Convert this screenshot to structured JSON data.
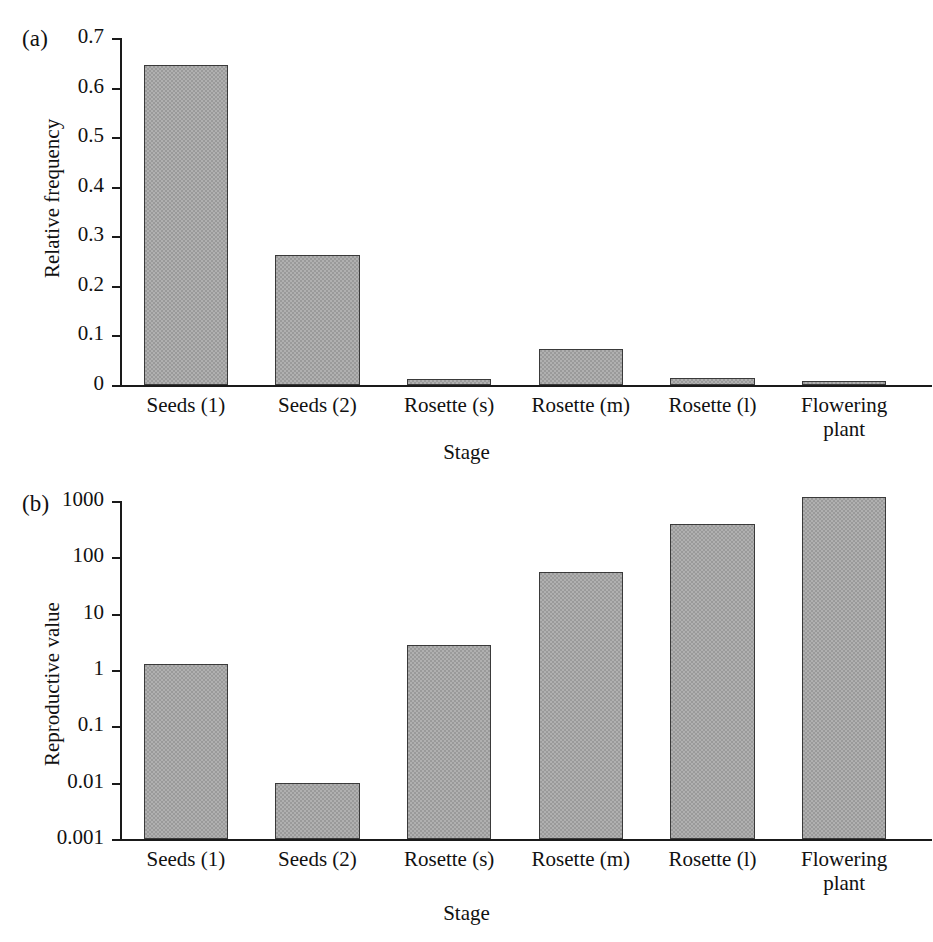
{
  "figure": {
    "panels": [
      {
        "tag": "(a)",
        "ylabel": "Relative frequency",
        "xlabel": "Stage"
      },
      {
        "tag": "(b)",
        "ylabel": "Reproductive value",
        "xlabel": "Stage"
      }
    ]
  },
  "chart_data": [
    {
      "type": "bar",
      "panel": "(a)",
      "title": "",
      "xlabel": "Stage",
      "ylabel": "Relative frequency",
      "categories": [
        "Seeds (1)",
        "Seeds (2)",
        "Rosette (s)",
        "Rosette (m)",
        "Rosette (l)",
        "Flowering plant"
      ],
      "values": [
        0.645,
        0.263,
        0.012,
        0.073,
        0.014,
        0.008
      ],
      "yscale": "linear",
      "ylim": [
        0,
        0.7
      ],
      "yticks": [
        0,
        0.1,
        0.2,
        0.3,
        0.4,
        0.5,
        0.6,
        0.7
      ],
      "ytick_labels": [
        "0",
        "0.1",
        "0.2",
        "0.3",
        "0.4",
        "0.5",
        "0.6",
        "0.7"
      ],
      "grid": false,
      "legend": false,
      "bar_color": "#9a9a9a",
      "bar_edge_color": "#3a3a3a"
    },
    {
      "type": "bar",
      "panel": "(b)",
      "title": "",
      "xlabel": "Stage",
      "ylabel": "Reproductive value",
      "categories": [
        "Seeds (1)",
        "Seeds (2)",
        "Rosette (s)",
        "Rosette (m)",
        "Rosette (l)",
        "Flowering plant"
      ],
      "values": [
        1.3,
        0.01,
        2.8,
        55,
        390,
        1200
      ],
      "yscale": "log",
      "ylim": [
        0.001,
        1000
      ],
      "yticks": [
        0.001,
        0.01,
        0.1,
        1,
        10,
        100,
        1000
      ],
      "ytick_labels": [
        "0.001",
        "0.01",
        "0.1",
        "1",
        "10",
        "100",
        "1000"
      ],
      "grid": false,
      "legend": false,
      "bar_color": "#9a9a9a",
      "bar_edge_color": "#3a3a3a"
    }
  ]
}
